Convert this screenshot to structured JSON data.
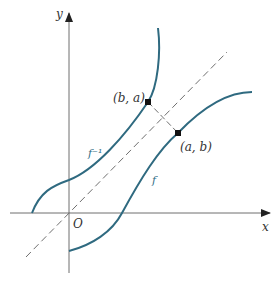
{
  "diagram": {
    "colors": {
      "curve": "#2f6a80",
      "axis": "#6f6f6f",
      "dashed": "#6f6f6f",
      "label_blue": "#2f6e86"
    },
    "axes": {
      "x_label": "x",
      "y_label": "y",
      "origin_label": "O"
    },
    "curves": {
      "f_label": "f",
      "f_inverse_label": "f⁻¹"
    },
    "points": {
      "p1_label": "(b, a)",
      "p2_label": "(a, b)"
    },
    "line": {
      "name": "y = x",
      "style": "dashed"
    }
  }
}
